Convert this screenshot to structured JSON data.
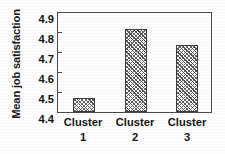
{
  "chart_data": {
    "type": "bar",
    "title": "",
    "xlabel": "",
    "ylabel": "Mean job satisfaction",
    "categories": [
      "Cluster 1",
      "Cluster 2",
      "Cluster 3"
    ],
    "category_lines": [
      {
        "line1": "Cluster",
        "line2": "1"
      },
      {
        "line1": "Cluster",
        "line2": "2"
      },
      {
        "line1": "Cluster",
        "line2": "3"
      }
    ],
    "values": [
      4.47,
      4.81,
      4.73
    ],
    "ylim": [
      4.4,
      4.9
    ],
    "yticks": [
      4.9,
      4.8,
      4.7,
      4.6,
      4.5,
      4.4
    ],
    "ytick_labels": [
      "4.9",
      "4.8",
      "4.7",
      "4.6",
      "4.5",
      "4.4"
    ],
    "grid": false,
    "legend": false,
    "legend_position": "none",
    "bar_fill": "diagonal-crosshatch",
    "colors": {
      "axis": "#4a4a4a",
      "bar_edge": "#3d3d3d",
      "bar_hatch": "#555555",
      "background": "#ffffff",
      "text": "#161616"
    }
  }
}
